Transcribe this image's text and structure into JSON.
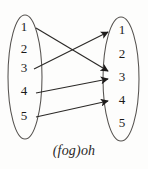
{
  "diagram": {
    "type": "function-composition-mapping-diagram",
    "caption": "(fog)oh",
    "colors": {
      "background": "#fdfdfc",
      "ellipse_stroke": "#55524f",
      "arrow": "#1d1b1a",
      "text": "#1a1a1a"
    },
    "domain_set": {
      "name": "domain-ellipse",
      "elements": [
        {
          "label": "1",
          "x": 24,
          "y": 31
        },
        {
          "label": "2",
          "x": 24,
          "y": 53
        },
        {
          "label": "3",
          "x": 24,
          "y": 72
        },
        {
          "label": "4",
          "x": 24,
          "y": 95
        },
        {
          "label": "5",
          "x": 24,
          "y": 120
        }
      ],
      "ellipse": {
        "cx": 25,
        "cy": 77,
        "rx": 17,
        "ry": 62
      }
    },
    "codomain_set": {
      "name": "codomain-ellipse",
      "elements": [
        {
          "label": "1",
          "x": 122,
          "y": 34
        },
        {
          "label": "2",
          "x": 122,
          "y": 58
        },
        {
          "label": "3",
          "x": 122,
          "y": 81
        },
        {
          "label": "4",
          "x": 122,
          "y": 104
        },
        {
          "label": "5",
          "x": 122,
          "y": 127
        }
      ],
      "ellipse": {
        "cx": 121,
        "cy": 79,
        "rx": 18,
        "ry": 62
      }
    },
    "mappings": [
      {
        "name": "arrow-1-to-3",
        "from": "1",
        "to": "3",
        "x1": 36,
        "y1": 28,
        "x2": 110,
        "y2": 71
      },
      {
        "name": "arrow-3-to-1",
        "from": "3",
        "to": "1",
        "x1": 34,
        "y1": 69,
        "x2": 110,
        "y2": 31
      },
      {
        "name": "arrow-4-to-3",
        "from": "4",
        "to": "3",
        "x1": 36,
        "y1": 93,
        "x2": 110,
        "y2": 79
      },
      {
        "name": "arrow-5-to-4",
        "from": "5",
        "to": "4",
        "x1": 36,
        "y1": 117,
        "x2": 110,
        "y2": 101
      }
    ]
  }
}
